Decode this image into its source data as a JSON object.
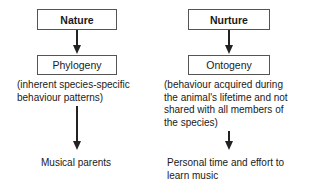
{
  "diagram": {
    "left": {
      "top_label": "Nature",
      "mid_label": "Phylogeny",
      "description": [
        "(inherent species-specific",
        "behaviour patterns)"
      ],
      "outcome": "Musical parents"
    },
    "right": {
      "top_label": "Nurture",
      "mid_label": "Ontogeny",
      "description": [
        "(behaviour acquired during",
        "the animal's lifetime and not",
        "shared with all members of",
        "the species)"
      ],
      "outcome": [
        "Personal time and effort to",
        "learn music"
      ]
    }
  }
}
